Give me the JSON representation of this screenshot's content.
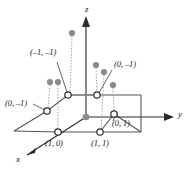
{
  "figure": {
    "kind": "3d-lattice-plane-diagram",
    "width": 192,
    "height": 176,
    "background": "#ffffff",
    "line_color": "#3d3d3d",
    "axis_color": "#2b2b2b",
    "dot_fill": "#8a8a8a",
    "open_circle_fill": "#ffffff",
    "open_circle_stroke": "#2b2b2b",
    "dotted_color": "#9a9a9a"
  },
  "axes": [
    {
      "id": "x",
      "label": "x",
      "label_x": 16,
      "label_y": 158
    },
    {
      "id": "y",
      "label": "y",
      "label_x": 178,
      "label_y": 106
    },
    {
      "id": "z",
      "label": "z",
      "label_x": 86,
      "label_y": 6
    }
  ],
  "point_labels": [
    {
      "id": "neg1-neg1",
      "text": "(–1, –1)",
      "x": 30,
      "y": 52
    },
    {
      "id": "zero-neg1-right",
      "text": "(0, –1)",
      "x": 114,
      "y": 63
    },
    {
      "id": "zero-neg1-left",
      "text": "(0, –1)",
      "x": 6,
      "y": 103
    },
    {
      "id": "zero-one",
      "text": "(0, 1)",
      "x": 113,
      "y": 123
    },
    {
      "id": "one-zero",
      "text": "(1, 0)",
      "x": 45,
      "y": 143
    },
    {
      "id": "one-one",
      "text": "(1, 1)",
      "x": 91,
      "y": 143
    }
  ],
  "open_circles": [
    {
      "id": "oc-upper-left",
      "cx": 68,
      "cy": 95
    },
    {
      "id": "oc-upper-right",
      "cx": 97,
      "cy": 95
    },
    {
      "id": "oc-mid-left",
      "cx": 47,
      "cy": 111
    },
    {
      "id": "oc-mid-right",
      "cx": 114,
      "cy": 114
    },
    {
      "id": "oc-lower-left",
      "cx": 58,
      "cy": 132
    },
    {
      "id": "oc-lower-right",
      "cx": 100,
      "cy": 132
    }
  ],
  "filled_dots": [
    {
      "id": "fd-a",
      "cx": 72,
      "cy": 33,
      "base_x": 68,
      "base_y": 95
    },
    {
      "id": "fd-b",
      "cx": 50,
      "cy": 82,
      "base_x": 47,
      "base_y": 111
    },
    {
      "id": "fd-c",
      "cx": 96,
      "cy": 65,
      "base_x": 97,
      "base_y": 95
    },
    {
      "id": "fd-d",
      "cx": 104,
      "cy": 72,
      "base_x": 100,
      "base_y": 132
    },
    {
      "id": "fd-e",
      "cx": 113,
      "cy": 85,
      "base_x": 114,
      "base_y": 114
    },
    {
      "id": "fd-f",
      "cx": 50,
      "cy": 82,
      "base_x": 58,
      "base_y": 132
    },
    {
      "id": "fd-g",
      "cx": 86,
      "cy": 117,
      "base_x": 86,
      "base_y": 117
    }
  ],
  "leader_lines": [
    {
      "id": "leader-neg1-neg1",
      "x1": 57,
      "y1": 62,
      "x2": 67,
      "y2": 93
    },
    {
      "id": "leader-zero-neg1-right",
      "x1": 113,
      "y1": 70,
      "x2": 99,
      "y2": 93
    }
  ]
}
